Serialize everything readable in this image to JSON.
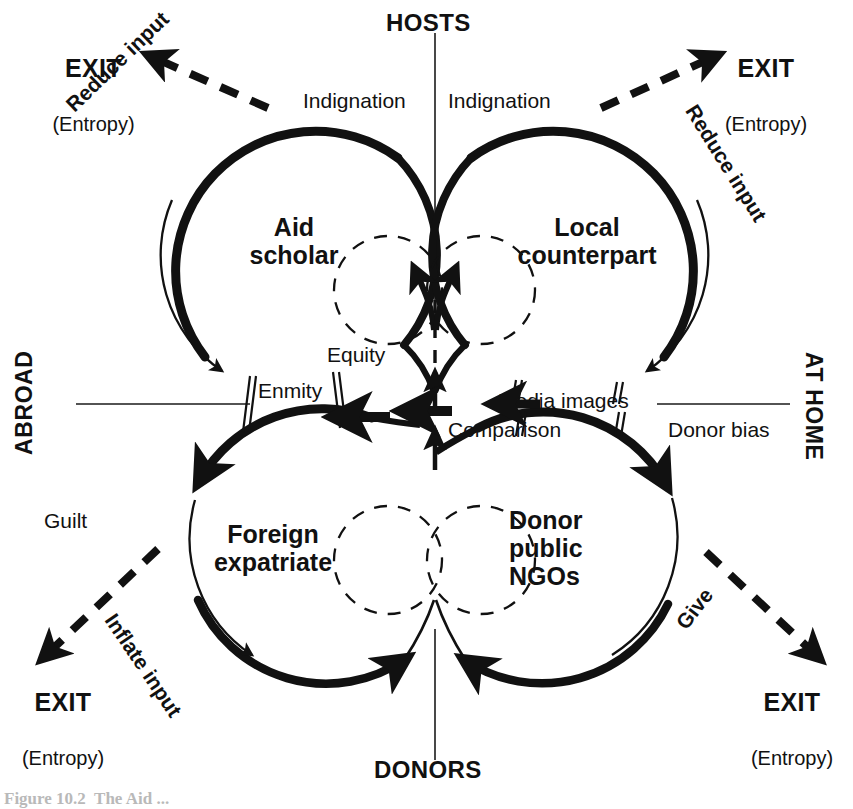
{
  "figure": {
    "caption_partial": "Figure 10.2  The Aid ..."
  },
  "axes": {
    "top_pole": "HOSTS",
    "bottom_pole": "DONORS",
    "left_pole": "ABROAD",
    "right_pole": "AT HOME"
  },
  "nodes": [
    {
      "id": "aid-scholar",
      "label": "Aid\nscholar",
      "quadrant": "top-left"
    },
    {
      "id": "local-counterpart",
      "label": "Local\ncounterpart",
      "quadrant": "top-right"
    },
    {
      "id": "foreign-expatriate",
      "label": "Foreign\nexpatriate",
      "quadrant": "bottom-left"
    },
    {
      "id": "donor-public-ngos",
      "label": "Donor\npublic\nNGOs",
      "quadrant": "bottom-right"
    }
  ],
  "exits": [
    {
      "id": "exit-top-left",
      "label": "EXIT",
      "sub": "(Entropy)"
    },
    {
      "id": "exit-top-right",
      "label": "EXIT",
      "sub": "(Entropy)"
    },
    {
      "id": "exit-bottom-left",
      "label": "EXIT",
      "sub": "(Entropy)"
    },
    {
      "id": "exit-bottom-right",
      "label": "EXIT",
      "sub": "(Entropy)"
    }
  ],
  "flows": {
    "indignation_left": "Indignation",
    "indignation_right": "Indignation",
    "reduce_input_left": "Reduce input",
    "reduce_input_right": "Reduce input",
    "equity": "Equity",
    "enmity": "Enmity",
    "media_images": "Media images",
    "comparison": "Comparison",
    "donor_bias": "Donor bias",
    "guilt": "Guilt",
    "inflate_input": "Inflate input",
    "give": "Give"
  },
  "colors": {
    "ink": "#111111",
    "background": "#ffffff",
    "thin_rule": "#1a1a1a"
  }
}
